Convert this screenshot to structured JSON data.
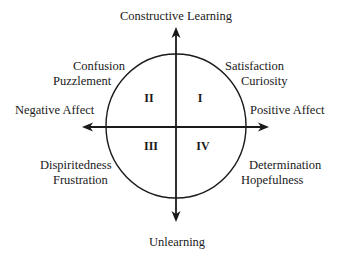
{
  "diagram": {
    "type": "four-quadrant circumplex",
    "axes": {
      "top": "Constructive Learning",
      "bottom": "Unlearning",
      "left": "Negative Affect",
      "right": "Positive Affect"
    },
    "quadrants": [
      {
        "numeral": "I",
        "position": "top-right",
        "emotions": [
          "Satisfaction",
          "Curiosity"
        ]
      },
      {
        "numeral": "II",
        "position": "top-left",
        "emotions": [
          "Confusion",
          "Puzzlement"
        ]
      },
      {
        "numeral": "III",
        "position": "bottom-left",
        "emotions": [
          "Dispiritedness",
          "Frustration"
        ]
      },
      {
        "numeral": "IV",
        "position": "bottom-right",
        "emotions": [
          "Determination",
          "Hopefulness"
        ]
      }
    ],
    "colors": {
      "stroke": "#1a1a1a",
      "background": "#ffffff"
    }
  }
}
